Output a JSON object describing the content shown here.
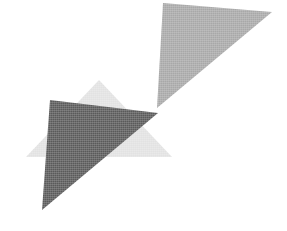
{
  "image": {
    "title": "Abstract triangle composition",
    "width": 287,
    "height": 231,
    "background_color": "#ffffff",
    "description": "Three overlapping solid triangles forming an abstract arrow-like mark; scanned halftone texture."
  },
  "palette": {
    "background": "#ffffff",
    "medium_gray": "#a8a8a8",
    "light_gray": "#e2e2e2",
    "dark_gray": "#5a5a5a"
  },
  "shapes": [
    {
      "name": "upper-right-triangle",
      "fill": "#a8a8a8",
      "points": "163,3 272,12 157,108",
      "vertices": [
        {
          "x": 163,
          "y": 3
        },
        {
          "x": 272,
          "y": 12
        },
        {
          "x": 157,
          "y": 108
        }
      ]
    },
    {
      "name": "center-light-triangle",
      "fill": "#e2e2e2",
      "points": "99,80 172,157 26,157",
      "vertices": [
        {
          "x": 99,
          "y": 80
        },
        {
          "x": 172,
          "y": 157
        },
        {
          "x": 26,
          "y": 157
        }
      ]
    },
    {
      "name": "lower-left-dark-triangle",
      "fill": "#5a5a5a",
      "points": "50,100 158,113 42,210",
      "vertices": [
        {
          "x": 50,
          "y": 100
        },
        {
          "x": 158,
          "y": 113
        },
        {
          "x": 42,
          "y": 210
        }
      ]
    }
  ]
}
